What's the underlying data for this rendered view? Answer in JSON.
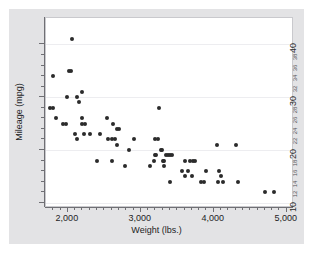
{
  "header": {
    "cut_off_text": ""
  },
  "colors": {
    "panel_background": "#e3e3e5",
    "plot_background": "#ffffff",
    "marker": "#2b2b2b",
    "gridline": "#ededf0",
    "axis": "#6f6f74"
  },
  "chart_data": {
    "type": "scatter",
    "title": "",
    "xlabel": "Weight (lbs.)",
    "ylabel": "Mileage (mpg)",
    "xlim": [
      1700,
      5100
    ],
    "ylim": [
      9,
      45
    ],
    "grid": true,
    "gridlines_y": [
      10,
      20,
      30,
      40
    ],
    "legend": "none",
    "x_major_ticks": [
      2000,
      3000,
      4000,
      5000
    ],
    "x_major_tick_labels": [
      "2,000",
      "3,000",
      "4,000",
      "5,000"
    ],
    "x_minor_tick_step": 100,
    "y_major_ticks": [
      10,
      20,
      30,
      40
    ],
    "y_major_tick_labels": [
      "10",
      "20",
      "30",
      "40"
    ],
    "y_minor_ticks": [
      12,
      14,
      16,
      18,
      22,
      24,
      26,
      28,
      32,
      34,
      36,
      38
    ],
    "y_minor_tick_labels": [
      "12",
      "14",
      "16",
      "18",
      "22",
      "24",
      "26",
      "28",
      "32",
      "34",
      "36",
      "38"
    ],
    "marker_shape": "circle",
    "points": [
      {
        "x": 2050,
        "y": 41
      },
      {
        "x": 2020,
        "y": 35
      },
      {
        "x": 2040,
        "y": 35
      },
      {
        "x": 1800,
        "y": 34
      },
      {
        "x": 2200,
        "y": 31
      },
      {
        "x": 1990,
        "y": 30
      },
      {
        "x": 2130,
        "y": 30
      },
      {
        "x": 2150,
        "y": 29
      },
      {
        "x": 1760,
        "y": 28
      },
      {
        "x": 1790,
        "y": 28
      },
      {
        "x": 3250,
        "y": 28
      },
      {
        "x": 1840,
        "y": 26
      },
      {
        "x": 2200,
        "y": 26
      },
      {
        "x": 2540,
        "y": 26
      },
      {
        "x": 1930,
        "y": 25
      },
      {
        "x": 1980,
        "y": 25
      },
      {
        "x": 2200,
        "y": 25
      },
      {
        "x": 2230,
        "y": 25
      },
      {
        "x": 2620,
        "y": 25
      },
      {
        "x": 2670,
        "y": 24
      },
      {
        "x": 2700,
        "y": 24
      },
      {
        "x": 2100,
        "y": 23
      },
      {
        "x": 2220,
        "y": 23
      },
      {
        "x": 2310,
        "y": 23
      },
      {
        "x": 2440,
        "y": 23
      },
      {
        "x": 2130,
        "y": 22
      },
      {
        "x": 2550,
        "y": 22
      },
      {
        "x": 2600,
        "y": 22
      },
      {
        "x": 2640,
        "y": 22
      },
      {
        "x": 2900,
        "y": 22
      },
      {
        "x": 3200,
        "y": 22
      },
      {
        "x": 3230,
        "y": 22
      },
      {
        "x": 2680,
        "y": 21
      },
      {
        "x": 4050,
        "y": 21
      },
      {
        "x": 4300,
        "y": 21
      },
      {
        "x": 2840,
        "y": 20
      },
      {
        "x": 3280,
        "y": 20
      },
      {
        "x": 3290,
        "y": 20
      },
      {
        "x": 3190,
        "y": 19
      },
      {
        "x": 3210,
        "y": 19
      },
      {
        "x": 3340,
        "y": 19
      },
      {
        "x": 3370,
        "y": 19
      },
      {
        "x": 3400,
        "y": 19
      },
      {
        "x": 3430,
        "y": 19
      },
      {
        "x": 2400,
        "y": 18
      },
      {
        "x": 2600,
        "y": 18
      },
      {
        "x": 3180,
        "y": 18
      },
      {
        "x": 3300,
        "y": 18
      },
      {
        "x": 3320,
        "y": 18
      },
      {
        "x": 3610,
        "y": 18
      },
      {
        "x": 3680,
        "y": 18
      },
      {
        "x": 3710,
        "y": 18
      },
      {
        "x": 3740,
        "y": 18
      },
      {
        "x": 2780,
        "y": 17
      },
      {
        "x": 3120,
        "y": 17
      },
      {
        "x": 3320,
        "y": 17
      },
      {
        "x": 3570,
        "y": 16
      },
      {
        "x": 3650,
        "y": 16
      },
      {
        "x": 3900,
        "y": 16
      },
      {
        "x": 4070,
        "y": 16
      },
      {
        "x": 3610,
        "y": 15
      },
      {
        "x": 3700,
        "y": 15
      },
      {
        "x": 4100,
        "y": 15
      },
      {
        "x": 3400,
        "y": 14
      },
      {
        "x": 3820,
        "y": 14
      },
      {
        "x": 3870,
        "y": 14
      },
      {
        "x": 4060,
        "y": 14
      },
      {
        "x": 4120,
        "y": 14
      },
      {
        "x": 4330,
        "y": 14
      },
      {
        "x": 4700,
        "y": 12
      },
      {
        "x": 4820,
        "y": 12
      }
    ]
  }
}
